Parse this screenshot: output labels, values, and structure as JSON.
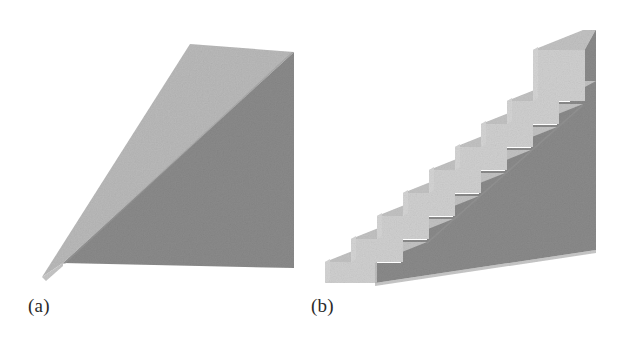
{
  "figure": {
    "background_color": "#ffffff",
    "width": 624,
    "height": 350,
    "caption_font_style": "serif",
    "panels": [
      {
        "id": "a",
        "label": "(a)",
        "object_name": "wedge",
        "description": "shaded three-dimensional wedge / inclined ramp block",
        "label_position": {
          "x": 28,
          "y": 296
        },
        "faces": {
          "slope_top": {
            "name": "slope-face",
            "color": "#b9b9b9",
            "points": "190,44 294,52 63,263 42,277"
          },
          "right_side": {
            "name": "right-side-face",
            "color": "#8a8a8a",
            "points": "294,52 294,268 63,263"
          },
          "left_end": {
            "name": "left-end-face",
            "color": "#c6c6c6",
            "points": "42,277 63,263 63,266 46,281"
          }
        },
        "bounds": {
          "x": 42,
          "y": 44,
          "width": 252,
          "height": 237
        }
      },
      {
        "id": "b",
        "label": "(b)",
        "object_name": "staircase",
        "description": "shaded three-dimensional staircase block with nine steps",
        "label_position": {
          "x": 311,
          "y": 296
        },
        "step_count": 9,
        "colors": {
          "tread": "#c2c2c2",
          "riser": "#cfcfcf",
          "side": "#8a8a8a",
          "base_front": "#bdbdbd"
        },
        "geometry": {
          "front_left_x": 325,
          "back_right_x": 596,
          "top_y": 30,
          "base_y": 283,
          "step_run": 26,
          "step_rise": 23,
          "depth_dx": 50,
          "depth_dy": -20
        },
        "bounds": {
          "x": 325,
          "y": 30,
          "width": 271,
          "height": 253
        }
      }
    ]
  }
}
